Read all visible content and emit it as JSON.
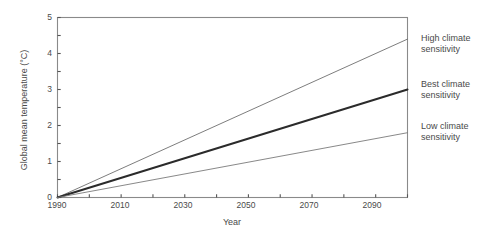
{
  "chart_data": {
    "type": "line",
    "title": "",
    "xlabel": "Year",
    "ylabel": "Global mean temperature (°C)",
    "xlim": [
      1990,
      2100
    ],
    "ylim": [
      0,
      5
    ],
    "grid": false,
    "legend_position": "right-inline-annotations",
    "x_ticks_major": [
      1990,
      2010,
      2030,
      2050,
      2070,
      2090
    ],
    "x_tick_labels": [
      "1990",
      "2010",
      "2030",
      "2050",
      "2070",
      "2090"
    ],
    "x_ticks_minor": [
      2000,
      2020,
      2040,
      2060,
      2080,
      2100
    ],
    "y_ticks_major": [
      0,
      1,
      2,
      3,
      4,
      5
    ],
    "y_tick_labels": [
      "0",
      "1",
      "2",
      "3",
      "4",
      "5"
    ],
    "y_ticks_minor": [
      0.5,
      1.5,
      2.5,
      3.5,
      4.5
    ],
    "x": [
      1990,
      2100
    ],
    "series": [
      {
        "name": "High climate sensitivity",
        "label_line1": "High climate",
        "label_line2": "sensitivity",
        "values": [
          0,
          4.4
        ],
        "color": "#6e6e6e",
        "width": 0.9
      },
      {
        "name": "Best climate sensitivity",
        "label_line1": "Best climate",
        "label_line2": "sensitivity",
        "values": [
          0,
          3.0
        ],
        "color": "#2b2b2b",
        "width": 2.0
      },
      {
        "name": "Low climate sensitivity",
        "label_line1": "Low climate",
        "label_line2": "sensitivity",
        "values": [
          0,
          1.8
        ],
        "color": "#7a7a7a",
        "width": 0.9
      }
    ]
  },
  "axes": {
    "frame_color": "#8a8a8a"
  }
}
